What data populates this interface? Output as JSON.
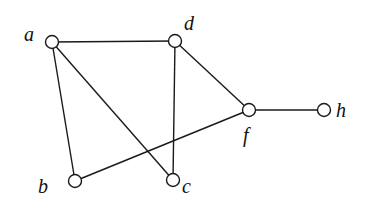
{
  "graph": {
    "nodes": [
      {
        "id": "a",
        "label": "a",
        "x": 52,
        "y": 42,
        "lx": 24,
        "ly": 41
      },
      {
        "id": "d",
        "label": "d",
        "x": 175,
        "y": 41,
        "lx": 184,
        "ly": 30
      },
      {
        "id": "f",
        "label": "f",
        "x": 249,
        "y": 110,
        "lx": 243,
        "ly": 142
      },
      {
        "id": "h",
        "label": "h",
        "x": 324,
        "y": 110,
        "lx": 336,
        "ly": 117
      },
      {
        "id": "c",
        "label": "c",
        "x": 173,
        "y": 180,
        "lx": 182,
        "ly": 193
      },
      {
        "id": "b",
        "label": "b",
        "x": 75,
        "y": 181,
        "lx": 38,
        "ly": 193
      }
    ],
    "edges": [
      [
        "a",
        "d"
      ],
      [
        "a",
        "b"
      ],
      [
        "a",
        "c"
      ],
      [
        "d",
        "c"
      ],
      [
        "d",
        "f"
      ],
      [
        "b",
        "f"
      ],
      [
        "f",
        "h"
      ]
    ],
    "node_radius": 6.5,
    "colors": {
      "stroke": "#1a1a1a",
      "fill": "#ffffff",
      "background": "#ffffff"
    }
  }
}
